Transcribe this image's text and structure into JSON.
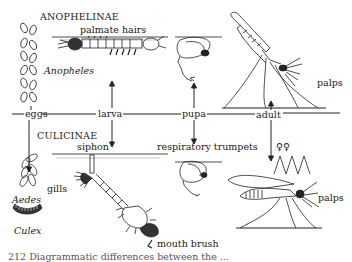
{
  "diagram": {
    "subfamilies": {
      "top": "ANOPHELINAE",
      "bottom": "CULICINAE"
    },
    "stages": [
      "eggs",
      "larva",
      "pupa",
      "adult"
    ],
    "genera": {
      "anopheles": "Anopheles",
      "aedes": "Aedes",
      "culex": "Culex"
    },
    "annotations": {
      "palmate_hairs": "palmate hairs",
      "palps_top": "palps",
      "siphon": "siphon",
      "respiratory_trumpets": "respiratory trumpets",
      "gills": "gills",
      "mouth_brush": "mouth brush",
      "female_symbol": "♀♀",
      "palps_bottom": "palps"
    },
    "caption": "212  Diagrammatic differences between the ..."
  }
}
